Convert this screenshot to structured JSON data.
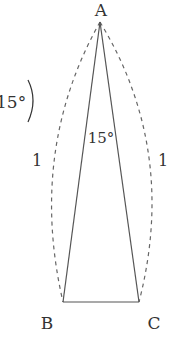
{
  "diagram": {
    "type": "isosceles-triangle",
    "vertices": {
      "A": {
        "label": "A",
        "x": 100,
        "y": 22
      },
      "B": {
        "label": "B",
        "x": 63,
        "y": 302
      },
      "C": {
        "label": "C",
        "x": 139,
        "y": 302
      }
    },
    "apex_angle_label": "15°",
    "side_label_left": "1",
    "side_label_right": "1",
    "partial_label_left": "15°)",
    "colors": {
      "line": "#555555",
      "text": "#333333",
      "dash": "#666666"
    }
  }
}
